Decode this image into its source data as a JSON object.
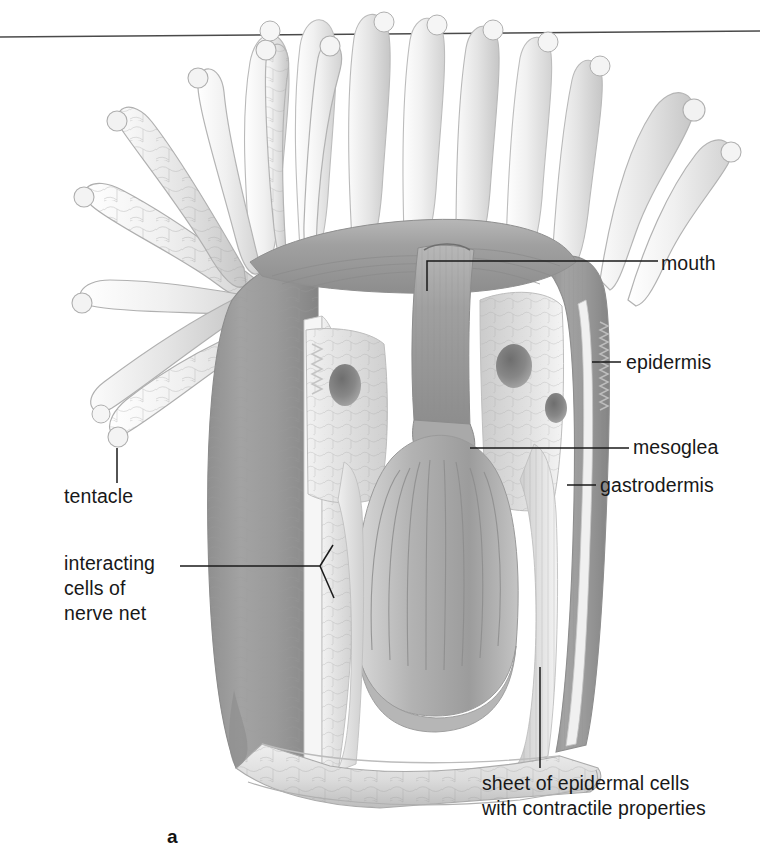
{
  "figure": {
    "panel_letter": "a",
    "style": "greyscale pencil illustration"
  },
  "labels": {
    "mouth": "mouth",
    "epidermis": "epidermis",
    "mesoglea": "mesoglea",
    "gastrodermis": "gastrodermis",
    "tentacle": "tentacle",
    "nerve_net": "interacting\ncells of\nnerve net",
    "nerve_net_line1": "interacting",
    "nerve_net_line2": "cells of",
    "nerve_net_line3": "nerve net",
    "sheet_caption": "sheet of epidermal cells\nwith contractile properties",
    "sheet_caption_line1": "sheet of epidermal cells",
    "sheet_caption_line2": "with contractile properties"
  },
  "colors": {
    "background": "#ffffff",
    "text": "#181818",
    "leader_line": "#1a1a1a",
    "rule_line": "#4a4a4a",
    "column_dark": "#9b9b9b",
    "column_mid": "#b4b4b4",
    "tissue_light": "#e8e8e8",
    "tissue_pale": "#f4f4f4",
    "septa_grey": "#a8a8a8",
    "outline": "#8a8a8a"
  },
  "annotations": {
    "top_rule": "horizontal rule across top of figure"
  }
}
